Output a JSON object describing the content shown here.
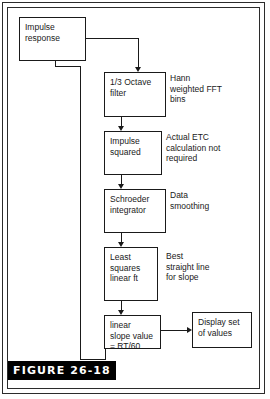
{
  "figure": {
    "label": "FIGURE 26-18",
    "caption_plate_color": "#000000",
    "caption_text_color": "#ffffff",
    "border_color": "#2b2b2b",
    "line_color": "#1a1a1a",
    "background_color": "#ffffff"
  },
  "nodes": [
    {
      "id": "impulse-response",
      "lines": [
        "Impulse",
        "response"
      ]
    },
    {
      "id": "third-octave-filter",
      "lines": [
        "1/3 Octave",
        "filter"
      ]
    },
    {
      "id": "impulse-squared",
      "lines": [
        "Impulse",
        "squared"
      ]
    },
    {
      "id": "schroeder-integrator",
      "lines": [
        "Schroeder",
        "integrator"
      ]
    },
    {
      "id": "least-squares-linear-fit",
      "lines": [
        "Least",
        "squares",
        "linear ft"
      ]
    },
    {
      "id": "linear-slope-value",
      "lines": [
        "linear",
        "slope value",
        "= RT/60"
      ]
    },
    {
      "id": "display-set-of-values",
      "lines": [
        "Display set",
        "of values"
      ]
    }
  ],
  "notes": [
    {
      "id": "hann-weighted-fft-bins",
      "lines": [
        "Hann",
        "weighted FFT",
        "bins"
      ]
    },
    {
      "id": "actual-etc-calculation-not-required",
      "lines": [
        "Actual ETC",
        "calculation not",
        "required"
      ]
    },
    {
      "id": "data-smoothing",
      "lines": [
        "Data",
        "smoothing"
      ]
    },
    {
      "id": "best-straight-line-for-slope",
      "lines": [
        "Best",
        "straight line",
        "for slope"
      ]
    }
  ],
  "flow": {
    "type": "flowchart",
    "direction": "top-to-bottom with feedback loop",
    "edges": [
      {
        "from": "impulse-response",
        "to": "third-octave-filter",
        "style": "orthogonal",
        "arrow": "down"
      },
      {
        "from": "third-octave-filter",
        "to": "impulse-squared",
        "style": "straight",
        "arrow": "down"
      },
      {
        "from": "impulse-squared",
        "to": "schroeder-integrator",
        "style": "straight",
        "arrow": "down"
      },
      {
        "from": "schroeder-integrator",
        "to": "least-squares-linear-fit",
        "style": "straight",
        "arrow": "down"
      },
      {
        "from": "least-squares-linear-fit",
        "to": "linear-slope-value",
        "style": "straight",
        "arrow": "down"
      },
      {
        "from": "linear-slope-value",
        "to": "display-set-of-values",
        "style": "straight",
        "arrow": "right"
      },
      {
        "from": "linear-slope-value",
        "to": "impulse-response",
        "style": "orthogonal-feedback",
        "arrow": "up"
      }
    ]
  }
}
